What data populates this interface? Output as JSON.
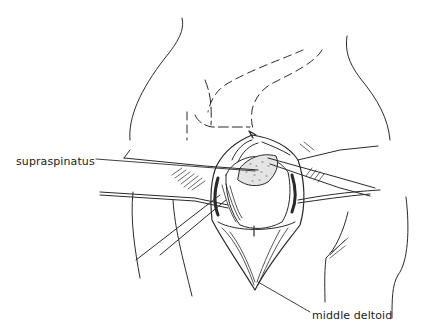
{
  "figure": {
    "line_color": "#2a2a2a",
    "background": "#ffffff"
  },
  "labels": {
    "supraspinatus": "supraspinatus",
    "middle_deltoid": "middle deltoid"
  }
}
